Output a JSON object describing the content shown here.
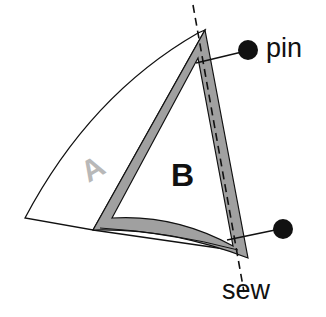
{
  "diagram": {
    "labels": {
      "piece_a": "A",
      "piece_b": "B",
      "pin": "pin",
      "sew": "sew"
    },
    "colors": {
      "outline": "#111111",
      "seam_allowance": "#a0a0a0",
      "label_a": "#b8b8b8",
      "label_b": "#111111",
      "pin_head": "#111111",
      "background": "#ffffff"
    }
  }
}
